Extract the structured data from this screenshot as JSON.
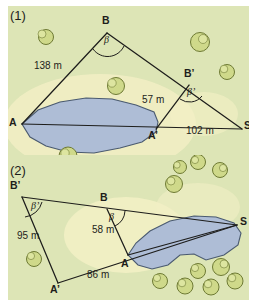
{
  "figure": {
    "kind": "geometry-survey-diagram",
    "background_color": "#ffffff",
    "width": 257,
    "height": 307
  },
  "colors": {
    "grass": "#dde5b6",
    "grass_alt": "#e2e9bc",
    "clearing": "#f2efc4",
    "water": "#aebdd6",
    "water_stroke": "#4a5a70",
    "bush_fill": "#cfd98a",
    "bush_stroke": "#6e7a34",
    "line": "#1d1d1b",
    "text": "#1d1d1b"
  },
  "panels": [
    {
      "id": "panel-1",
      "number": "(1)",
      "number_pos": {
        "x": 10,
        "y": 8
      },
      "vertices": [
        {
          "name": "A",
          "label": "A",
          "x": 14,
          "y": 118,
          "lx": 2,
          "ly": 112
        },
        {
          "name": "B",
          "label": "B",
          "x": 99,
          "y": 27,
          "lx": 95,
          "ly": 10
        },
        {
          "name": "S",
          "label": "S",
          "x": 234,
          "y": 123,
          "lx": 236,
          "ly": 115
        },
        {
          "name": "A'",
          "label": "A’",
          "x": 148,
          "y": 123,
          "lx": 141,
          "ly": 126
        },
        {
          "name": "B'",
          "label": "B’",
          "x": 181,
          "y": 79,
          "lx": 177,
          "ly": 64
        }
      ],
      "segments": [
        {
          "from": "A",
          "to": "B",
          "name": "A-B"
        },
        {
          "from": "B",
          "to": "S",
          "name": "B-S"
        },
        {
          "from": "A",
          "to": "S",
          "name": "A-S"
        },
        {
          "from": "A'",
          "to": "B'",
          "name": "Aprime-Bprime"
        }
      ],
      "measures": [
        {
          "name": "measure-138m",
          "text": "138 m",
          "x": 27,
          "y": 57
        },
        {
          "name": "measure-57m",
          "text": "57 m",
          "x": 135,
          "y": 91
        },
        {
          "name": "measure-102m",
          "text": "102 m",
          "x": 179,
          "y": 122
        }
      ],
      "angles": [
        {
          "name": "angle-beta",
          "text": "β",
          "x": 98,
          "y": 34,
          "at": "B",
          "r": 18
        },
        {
          "name": "angle-beta-prime",
          "text": "β’",
          "x": 182,
          "y": 88,
          "at": "B’",
          "r": 17
        }
      ],
      "lake": {
        "name": "lake-shape",
        "cx": 82,
        "cy": 121
      },
      "clearing": {
        "name": "clearing-patch",
        "cx": 92,
        "cy": 118
      },
      "bushes": [
        {
          "x": 38,
          "y": 31,
          "r": 8
        },
        {
          "x": 108,
          "y": 80,
          "r": 9
        },
        {
          "x": 192,
          "y": 36,
          "r": 10
        },
        {
          "x": 219,
          "y": 66,
          "r": 8
        },
        {
          "x": 60,
          "y": 153,
          "r": 9
        }
      ]
    },
    {
      "id": "panel-2",
      "number": "(2)",
      "number_pos": {
        "x": 10,
        "y": 12
      },
      "vertices": [
        {
          "name": "B'",
          "label": "B’",
          "x": 14,
          "y": 42,
          "lx": 4,
          "ly": 27
        },
        {
          "name": "B",
          "label": "B",
          "x": 99,
          "y": 54,
          "lx": 93,
          "ly": 37
        },
        {
          "name": "S",
          "label": "S",
          "x": 229,
          "y": 70,
          "lx": 233,
          "ly": 62
        },
        {
          "name": "A",
          "label": "A",
          "x": 120,
          "y": 100,
          "lx": 114,
          "ly": 103
        },
        {
          "name": "A'",
          "label": "A’",
          "x": 50,
          "y": 128,
          "lx": 44,
          "ly": 130
        }
      ],
      "segments": [
        {
          "from": "B'",
          "to": "S",
          "name": "Bprime-S"
        },
        {
          "from": "B'",
          "to": "A'",
          "name": "Bprime-Aprime"
        },
        {
          "from": "A'",
          "to": "S",
          "name": "Aprime-S"
        },
        {
          "from": "B",
          "to": "A",
          "name": "B-A"
        },
        {
          "from": "A",
          "to": "S",
          "name": "A-S"
        }
      ],
      "measures": [
        {
          "name": "measure-95m",
          "text": "95 m",
          "x": 10,
          "y": 78
        },
        {
          "name": "measure-58m",
          "text": "58 m",
          "x": 85,
          "y": 72
        },
        {
          "name": "measure-86m",
          "text": "86 m",
          "x": 80,
          "y": 117
        }
      ],
      "angles": [
        {
          "name": "angle-beta-prime",
          "text": "β’",
          "x": 26,
          "y": 51,
          "at": "B’",
          "r": 20
        },
        {
          "name": "angle-beta",
          "text": "β",
          "x": 102,
          "y": 62,
          "at": "B",
          "r": 18
        }
      ],
      "lake": {
        "name": "lake-shape",
        "cx": 168,
        "cy": 82
      },
      "clearing": {
        "name": "clearing-patch",
        "cx": 118,
        "cy": 80
      },
      "bushes": [
        {
          "x": 172,
          "y": 12,
          "r": 7
        },
        {
          "x": 190,
          "y": 6,
          "r": 8
        },
        {
          "x": 212,
          "y": 14,
          "r": 8
        },
        {
          "x": 166,
          "y": 28,
          "r": 9
        },
        {
          "x": 26,
          "y": 105,
          "r": 8
        },
        {
          "x": 190,
          "y": 122,
          "r": 8
        },
        {
          "x": 212,
          "y": 118,
          "r": 9
        },
        {
          "x": 152,
          "y": 131,
          "r": 8
        },
        {
          "x": 176,
          "y": 136,
          "r": 8
        },
        {
          "x": 204,
          "y": 137,
          "r": 8
        },
        {
          "x": 228,
          "y": 130,
          "r": 8
        }
      ]
    }
  ]
}
